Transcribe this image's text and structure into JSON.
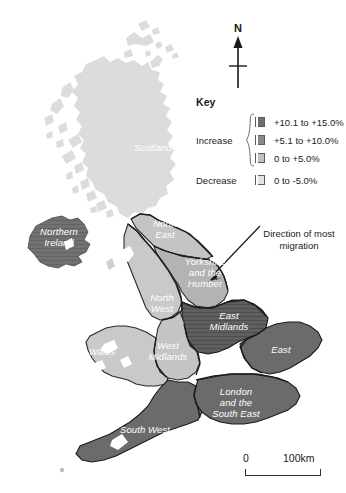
{
  "map": {
    "title": "UK internal migration by region",
    "background_color": "#ffffff",
    "north_arrow": {
      "label": "N",
      "icon": "north-arrow-icon"
    },
    "scale": {
      "zero_label": "0",
      "max_label": "100km"
    },
    "annotation": {
      "text": "Direction of most migration",
      "arrow_icon": "diagonal-arrow-icon"
    },
    "legend": {
      "title": "Key",
      "groups": [
        {
          "label": "Increase",
          "classes": [
            {
              "range": "+10.1 to +15.0%",
              "color": "#6e6e6e"
            },
            {
              "range": "+5.1 to +10.0%",
              "color": "#8a8a8a"
            },
            {
              "range": "0 to +5.0%",
              "color": "#c0c0c0"
            }
          ]
        },
        {
          "label": "Decrease",
          "classes": [
            {
              "range": "0 to -5.0%",
              "color": "#e2e2e2"
            }
          ]
        }
      ]
    },
    "regions": [
      {
        "name": "Scotland",
        "label": "Scotland",
        "class": "0 to -5.0%",
        "color": "#dcdcdc"
      },
      {
        "name": "Northern Ireland",
        "label": "Northern\nIreland",
        "class": "+5.1 to +10.0%",
        "color": "#6f6f6f"
      },
      {
        "name": "North East",
        "label": "North\nEast",
        "class": "0 to +5.0%",
        "color": "#c4c4c4"
      },
      {
        "name": "North West",
        "label": "North\nWest",
        "class": "0 to +5.0%",
        "color": "#c9c9c9"
      },
      {
        "name": "Yorkshire and the Humber",
        "label": "Yorkshire\nand the\nHumber",
        "class": "0 to +5.0%",
        "color": "#b3b3b3"
      },
      {
        "name": "East Midlands",
        "label": "East\nMidlands",
        "class": "+10.1 to +15.0%",
        "color": "#5f5f5f"
      },
      {
        "name": "West Midlands",
        "label": "West\nMidlands",
        "class": "0 to +5.0%",
        "color": "#c4c4c4"
      },
      {
        "name": "Wales",
        "label": "Wales",
        "class": "0 to +5.0%",
        "color": "#c9c9c9"
      },
      {
        "name": "East",
        "label": "East",
        "class": "+5.1 to +10.0%",
        "color": "#6b6b6b"
      },
      {
        "name": "London and the South East",
        "label": "London\nand the\nSouth East",
        "class": "+5.1 to +10.0%",
        "color": "#6b6b6b"
      },
      {
        "name": "South West",
        "label": "South West",
        "class": "+5.1 to +10.0%",
        "color": "#6b6b6b"
      }
    ]
  }
}
